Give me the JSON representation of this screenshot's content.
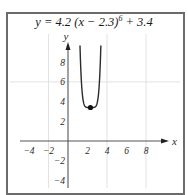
{
  "chart_data": {
    "type": "line",
    "title_parts": {
      "main": "y = 4.2 (x − 2.3)",
      "exp": "6",
      "tail": " + 3.4"
    },
    "function": {
      "a": 4.2,
      "h": 2.3,
      "n": 6,
      "k": 3.4
    },
    "xlabel": "x",
    "ylabel": "y",
    "xlim": [
      -5,
      10
    ],
    "ylim": [
      -5,
      10
    ],
    "x_ticks": [
      -4,
      -2,
      2,
      4,
      6,
      8
    ],
    "y_ticks": [
      8,
      6,
      4,
      2,
      -2,
      -4
    ],
    "grid": {
      "vertical": [
        -2,
        4,
        8
      ],
      "horizontal": [
        6
      ]
    },
    "highlight_point": {
      "x": 2.3,
      "y": 3.4,
      "label": "vertex"
    },
    "series": [
      {
        "name": "y = 4.2(x-2.3)^6 + 3.4",
        "color": "#2b2b2b"
      }
    ]
  },
  "colors": {
    "border": "#6b6b6b",
    "axis": "#555555",
    "grid": "#e2e2e2",
    "curve": "#2b2b2b"
  }
}
